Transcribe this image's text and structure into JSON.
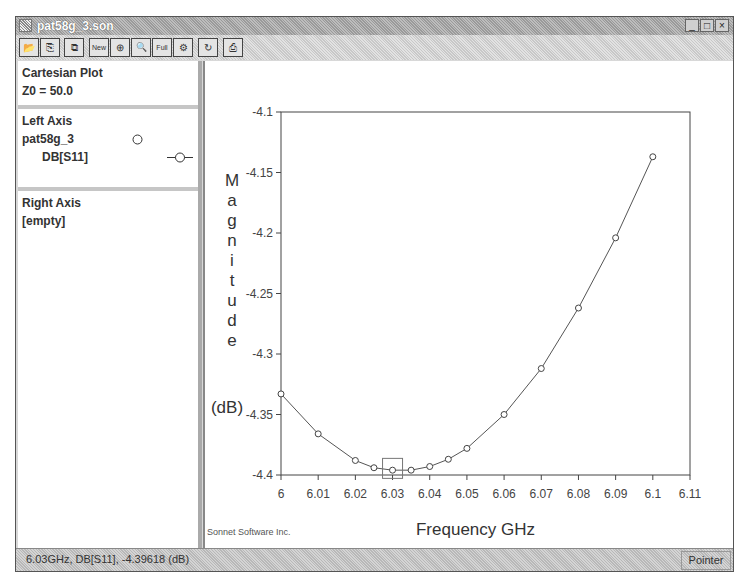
{
  "window": {
    "title": "pat58g_3.son",
    "controls": [
      "_",
      "□",
      "×"
    ]
  },
  "toolbar": {
    "buttons": [
      {
        "name": "open-button",
        "glyph": "📂"
      },
      {
        "name": "copy-plot-button",
        "glyph": "⎘"
      },
      {
        "name": "paste-button",
        "glyph": "⧉"
      },
      {
        "name": "new-plot-button",
        "glyph": "New"
      },
      {
        "name": "zoom-in-button",
        "glyph": "⊕"
      },
      {
        "name": "zoom-out-button",
        "glyph": "🔍"
      },
      {
        "name": "zoom-full-button",
        "glyph": "Full"
      },
      {
        "name": "add-curve-button",
        "glyph": "⚙"
      },
      {
        "name": "refresh-button",
        "glyph": "↻"
      },
      {
        "name": "print-button",
        "glyph": "⎙"
      }
    ]
  },
  "sidebar": {
    "plot_section": {
      "title": "Cartesian Plot",
      "z0": "Z0 = 50.0"
    },
    "left_axis": {
      "title": "Left Axis",
      "project": "pat58g_3",
      "curve": "DB[S11]"
    },
    "right_axis": {
      "title": "Right Axis",
      "value": "[empty]"
    }
  },
  "plot": {
    "credit": "Sonnet Software Inc."
  },
  "status": {
    "readout": "6.03GHz, DB[S11], -4.39618  (dB)",
    "mode": "Pointer"
  },
  "chart_data": {
    "type": "line",
    "title": "",
    "xlabel": "Frequency GHz",
    "ylabel": "Magnitude (dB)",
    "xlim": [
      6.0,
      6.11
    ],
    "ylim": [
      -4.4,
      -4.1
    ],
    "x_ticks": [
      "6",
      "6.01",
      "6.02",
      "6.03",
      "6.04",
      "6.05",
      "6.06",
      "6.07",
      "6.08",
      "6.09",
      "6.1",
      "6.11"
    ],
    "y_ticks": [
      "-4.1",
      "-4.15",
      "-4.2",
      "-4.25",
      "-4.3",
      "-4.35",
      "-4.4"
    ],
    "grid": false,
    "legend": {
      "position": "sidebar",
      "entries": [
        "DB[S11]"
      ]
    },
    "series": [
      {
        "name": "DB[S11]",
        "marker": "open-circle",
        "x": [
          6.0,
          6.01,
          6.02,
          6.025,
          6.03,
          6.035,
          6.04,
          6.045,
          6.05,
          6.06,
          6.07,
          6.08,
          6.09,
          6.1
        ],
        "values": [
          -4.333,
          -4.366,
          -4.388,
          -4.394,
          -4.396,
          -4.396,
          -4.393,
          -4.387,
          -4.378,
          -4.35,
          -4.312,
          -4.262,
          -4.204,
          -4.137
        ]
      }
    ],
    "annotations": [
      {
        "type": "marker-box",
        "x": 6.03,
        "y": -4.39618
      }
    ]
  }
}
